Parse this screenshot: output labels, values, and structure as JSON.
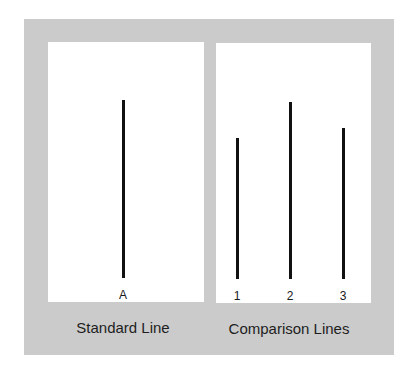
{
  "standard": {
    "caption": "Standard Line",
    "line": {
      "label": "A",
      "x": 123,
      "top": 100,
      "bottom": 278
    }
  },
  "comparison": {
    "caption": "Comparison Lines",
    "lines": [
      {
        "label": "1",
        "x": 237,
        "top": 138,
        "bottom": 279
      },
      {
        "label": "2",
        "x": 290,
        "top": 102,
        "bottom": 279
      },
      {
        "label": "3",
        "x": 343,
        "top": 128,
        "bottom": 279
      }
    ]
  },
  "colors": {
    "frame": "#cbcbcb",
    "panel": "#ffffff",
    "line": "#111111"
  }
}
